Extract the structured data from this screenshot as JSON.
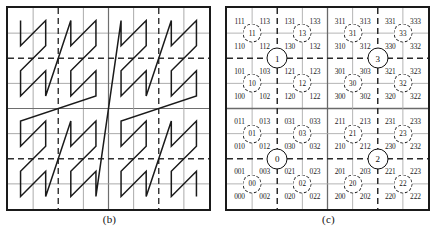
{
  "figure": {
    "panels": [
      {
        "id": "b",
        "caption": "(b)",
        "kind": "morton-curve"
      },
      {
        "id": "c",
        "caption": "(c)",
        "kind": "morton-code-grid"
      }
    ]
  },
  "panel_b": {
    "caption": "(b)",
    "grid": {
      "cols": 8,
      "rows": 8
    },
    "curve_name": "N-order curve",
    "dashed_fractions": [
      0.25,
      0.75
    ],
    "solid_mid_fraction": 0.5,
    "curve_color": "#1a1a1a",
    "grid_color": "#8e8e8e",
    "border_color": "#1a1a1a",
    "order": "morton-vertical-first",
    "cell_sequence": [
      [
        0,
        0
      ],
      [
        0,
        1
      ],
      [
        1,
        0
      ],
      [
        1,
        1
      ],
      [
        0,
        2
      ],
      [
        0,
        3
      ],
      [
        1,
        2
      ],
      [
        1,
        3
      ],
      [
        2,
        0
      ],
      [
        2,
        1
      ],
      [
        3,
        0
      ],
      [
        3,
        1
      ],
      [
        2,
        2
      ],
      [
        2,
        3
      ],
      [
        3,
        2
      ],
      [
        3,
        3
      ],
      [
        0,
        4
      ],
      [
        0,
        5
      ],
      [
        1,
        4
      ],
      [
        1,
        5
      ],
      [
        0,
        6
      ],
      [
        0,
        7
      ],
      [
        1,
        6
      ],
      [
        1,
        7
      ],
      [
        2,
        4
      ],
      [
        2,
        5
      ],
      [
        3,
        4
      ],
      [
        3,
        5
      ],
      [
        2,
        6
      ],
      [
        2,
        7
      ],
      [
        3,
        6
      ],
      [
        3,
        7
      ],
      [
        4,
        0
      ],
      [
        4,
        1
      ],
      [
        5,
        0
      ],
      [
        5,
        1
      ],
      [
        4,
        2
      ],
      [
        4,
        3
      ],
      [
        5,
        2
      ],
      [
        5,
        3
      ],
      [
        6,
        0
      ],
      [
        6,
        1
      ],
      [
        7,
        0
      ],
      [
        7,
        1
      ],
      [
        6,
        2
      ],
      [
        6,
        3
      ],
      [
        7,
        2
      ],
      [
        7,
        3
      ],
      [
        4,
        4
      ],
      [
        4,
        5
      ],
      [
        5,
        4
      ],
      [
        5,
        5
      ],
      [
        4,
        6
      ],
      [
        4,
        7
      ],
      [
        5,
        6
      ],
      [
        5,
        7
      ],
      [
        6,
        4
      ],
      [
        6,
        5
      ],
      [
        7,
        4
      ],
      [
        7,
        5
      ],
      [
        6,
        6
      ],
      [
        6,
        7
      ],
      [
        7,
        6
      ],
      [
        7,
        7
      ]
    ]
  },
  "panel_c": {
    "caption": "(c)",
    "grid": {
      "cols": 8,
      "rows": 8
    },
    "grid_color": "#9a9a9a",
    "dashed_color": "#2a2a2a",
    "border_color": "#1a1a1a",
    "leaf_codes": [
      [
        "111",
        "113",
        "131",
        "133",
        "311",
        "313",
        "331",
        "333"
      ],
      [
        "110",
        "112",
        "130",
        "132",
        "310",
        "312",
        "330",
        "332"
      ],
      [
        "101",
        "103",
        "121",
        "123",
        "301",
        "303",
        "321",
        "323"
      ],
      [
        "100",
        "102",
        "120",
        "122",
        "300",
        "302",
        "320",
        "322"
      ],
      [
        "011",
        "013",
        "031",
        "033",
        "211",
        "213",
        "231",
        "233"
      ],
      [
        "010",
        "012",
        "030",
        "032",
        "210",
        "212",
        "230",
        "232"
      ],
      [
        "001",
        "003",
        "021",
        "023",
        "201",
        "203",
        "221",
        "223"
      ],
      [
        "000",
        "002",
        "020",
        "022",
        "200",
        "202",
        "220",
        "222"
      ]
    ],
    "level2_nodes": [
      {
        "label": "11",
        "col": 0,
        "row": 0
      },
      {
        "label": "13",
        "col": 1,
        "row": 0
      },
      {
        "label": "31",
        "col": 2,
        "row": 0
      },
      {
        "label": "33",
        "col": 3,
        "row": 0
      },
      {
        "label": "10",
        "col": 0,
        "row": 1
      },
      {
        "label": "12",
        "col": 1,
        "row": 1
      },
      {
        "label": "30",
        "col": 2,
        "row": 1
      },
      {
        "label": "32",
        "col": 3,
        "row": 1
      },
      {
        "label": "01",
        "col": 0,
        "row": 2
      },
      {
        "label": "03",
        "col": 1,
        "row": 2
      },
      {
        "label": "21",
        "col": 2,
        "row": 2
      },
      {
        "label": "23",
        "col": 3,
        "row": 2
      },
      {
        "label": "00",
        "col": 0,
        "row": 3
      },
      {
        "label": "02",
        "col": 1,
        "row": 3
      },
      {
        "label": "20",
        "col": 2,
        "row": 3
      },
      {
        "label": "22",
        "col": 3,
        "row": 3
      }
    ],
    "level1_nodes": [
      {
        "label": "1",
        "col": 0,
        "row": 0
      },
      {
        "label": "3",
        "col": 1,
        "row": 0
      },
      {
        "label": "0",
        "col": 0,
        "row": 1
      },
      {
        "label": "2",
        "col": 1,
        "row": 1
      }
    ]
  }
}
